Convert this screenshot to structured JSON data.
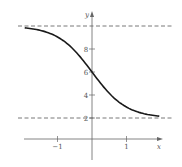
{
  "chart_data": {
    "type": "line",
    "title": "",
    "xlabel": "x",
    "ylabel": "y",
    "xlim": [
      -2,
      2
    ],
    "ylim": [
      0,
      10.5
    ],
    "grid": false,
    "legend": null,
    "x_ticks": [
      {
        "value": -1,
        "label": "−1"
      },
      {
        "value": 1,
        "label": "1"
      }
    ],
    "y_ticks": [
      {
        "value": 2,
        "label": "2"
      },
      {
        "value": 4,
        "label": "4"
      },
      {
        "value": 6,
        "label": "6"
      },
      {
        "value": 8,
        "label": "8"
      }
    ],
    "asymptotes": [
      {
        "orientation": "horizontal",
        "y": 10,
        "style": "dashed"
      },
      {
        "orientation": "horizontal",
        "y": 2,
        "style": "dashed"
      }
    ],
    "series": [
      {
        "name": "y = 2 + 8/(1 + e^(2x))",
        "x": [
          -1.95,
          -1.75,
          -1.5,
          -1.25,
          -1.0,
          -0.75,
          -0.5,
          -0.25,
          0.0,
          0.25,
          0.5,
          0.75,
          1.0,
          1.25,
          1.5,
          1.75,
          1.95
        ],
        "values": [
          9.84,
          9.76,
          9.6,
          9.35,
          8.95,
          8.36,
          7.54,
          6.98,
          6.0,
          5.02,
          4.15,
          3.45,
          2.95,
          2.61,
          2.38,
          2.23,
          2.16
        ]
      }
    ]
  },
  "plot": {
    "origin_px": [
      92,
      141
    ],
    "x_unit_px": 34.5,
    "y_unit_px": 11.5,
    "x_axis_range_px": [
      24,
      163
    ],
    "y_axis_range_px": [
      160,
      11
    ],
    "colors": {
      "axis": "#666666",
      "curve": "#1a1a1a",
      "asymptote": "#555555",
      "text": "#555555"
    }
  }
}
